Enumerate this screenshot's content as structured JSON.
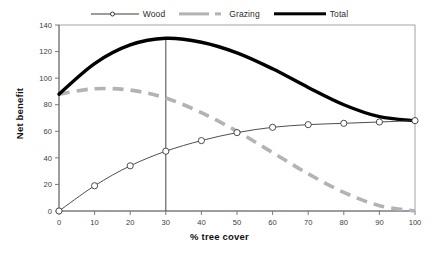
{
  "chart_data": {
    "type": "line",
    "title": "",
    "xlabel": "% tree cover",
    "ylabel": "Net benefit",
    "xlim": [
      0,
      100
    ],
    "ylim": [
      0,
      140
    ],
    "xticks": [
      0,
      10,
      20,
      30,
      40,
      50,
      60,
      70,
      80,
      90,
      100
    ],
    "yticks": [
      0,
      20,
      40,
      60,
      80,
      100,
      120,
      140
    ],
    "grid": false,
    "legend_position": "top-center",
    "x": [
      0,
      10,
      20,
      30,
      40,
      50,
      60,
      70,
      80,
      90,
      100
    ],
    "series": [
      {
        "name": "Wood",
        "values": [
          0,
          19,
          34,
          45,
          53,
          59,
          63,
          65,
          66,
          67,
          68
        ],
        "color": "#3a3a3a",
        "style": "solid-thin-markers",
        "marker": "open-circle"
      },
      {
        "name": "Grazing",
        "values": [
          88,
          92,
          91,
          85,
          74,
          60,
          44,
          28,
          14,
          4,
          0
        ],
        "color": "#b3b3b3",
        "style": "dashed-thick",
        "marker": "none"
      },
      {
        "name": "Total",
        "values": [
          88,
          111,
          125,
          130,
          127,
          119,
          107,
          93,
          80,
          71,
          68
        ],
        "color": "#000000",
        "style": "solid-thick",
        "marker": "none"
      }
    ],
    "annotations": [
      {
        "type": "vertical-line",
        "name": "optimum-marker",
        "x": 30,
        "y_from": 0,
        "y_to": 130,
        "color": "#555555"
      }
    ]
  },
  "legend": {
    "items": [
      {
        "label": "Wood"
      },
      {
        "label": "Grazing"
      },
      {
        "label": "Total"
      }
    ]
  },
  "axes": {
    "y_title": "Net benefit",
    "x_title": "% tree cover",
    "y_tick_labels": [
      "0",
      "20",
      "40",
      "60",
      "80",
      "100",
      "120",
      "140"
    ],
    "x_tick_labels": [
      "0",
      "10",
      "20",
      "30",
      "40",
      "50",
      "60",
      "70",
      "80",
      "90",
      "100"
    ]
  }
}
